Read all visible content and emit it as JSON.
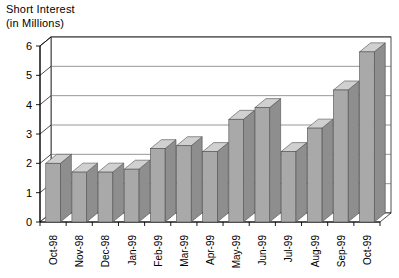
{
  "chart_data": {
    "type": "bar",
    "title": "Short Interest",
    "subtitle": "(in Millions)",
    "title_lines": [
      "Short Interest",
      "(in Millions)"
    ],
    "xlabel": "",
    "ylabel": "",
    "ylim": [
      0,
      6
    ],
    "yticks": [
      0,
      1,
      2,
      3,
      4,
      5,
      6
    ],
    "ytick_labels": [
      "0",
      "1",
      "2",
      "3",
      "4",
      "5",
      "6"
    ],
    "grid": true,
    "grid_axis": "y",
    "legend": false,
    "style_3d": true,
    "categories": [
      "Oct-98",
      "Nov-98",
      "Dec-98",
      "Jan-99",
      "Feb-99",
      "Mar-99",
      "Apr-99",
      "May-99",
      "Jun-99",
      "Jul-99",
      "Aug-99",
      "Sep-99",
      "Oct-99"
    ],
    "values": [
      2.0,
      1.7,
      1.7,
      1.8,
      2.5,
      2.6,
      2.4,
      3.5,
      3.9,
      2.4,
      3.2,
      4.5,
      5.8
    ],
    "series": [
      {
        "name": "Short Interest",
        "values": [
          2.0,
          1.7,
          1.7,
          1.8,
          2.5,
          2.6,
          2.4,
          3.5,
          3.9,
          2.4,
          3.2,
          4.5,
          5.8
        ]
      }
    ]
  },
  "colors": {
    "bar_front": "#a9a9a9",
    "bar_top": "#d0d0d0",
    "bar_side": "#8e8e8e",
    "axis": "#000000",
    "grid": "#6b6b6b",
    "background": "#ffffff",
    "text": "#000000"
  }
}
